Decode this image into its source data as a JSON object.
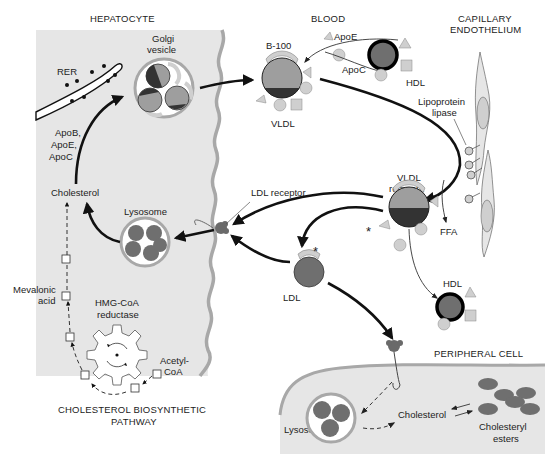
{
  "figure": {
    "colors": {
      "cell_fill": "#e6e6e6",
      "membrane": "#a8a8a8",
      "particle_core_light": "#9e9e9e",
      "particle_core_dark": "#3a3a3a",
      "ldl_core": "#6f6f6f",
      "apoprotein": "#cfcfcf",
      "hdl_ring": "#000000",
      "arrow": "#111111"
    }
  },
  "regions": {
    "hepatocyte": "HEPATOCYTE",
    "blood": "BLOOD",
    "capillary_endothelium_line1": "CAPILLARY",
    "capillary_endothelium_line2": "ENDOTHELIUM",
    "peripheral_cell": "PERIPHERAL CELL",
    "biosynthetic_pathway_line1": "CHOLESTEROL BIOSYNTHETIC",
    "biosynthetic_pathway_line2": "PATHWAY"
  },
  "labels": {
    "rer": "RER",
    "golgi_line1": "Golgi",
    "golgi_line2": "vesicle",
    "apob": "ApoB,",
    "apoe_list": "ApoE,",
    "apoc_list": "ApoC",
    "cholesterol_hepatocyte": "Cholesterol",
    "lysosome_hepatocyte": "Lysosome",
    "mevalonic_line1": "Mevalonic",
    "mevalonic_line2": "acid",
    "hmgcoa_line1": "HMG-CoA",
    "hmgcoa_line2": "reductase",
    "acetyl_line1": "Acetyl-",
    "acetyl_line2": "CoA",
    "b100": "B-100",
    "vldl": "VLDL",
    "apoe": "ApoE",
    "apoc": "ApoC",
    "hdl_top": "HDL",
    "lipoprotein_line1": "Lipoprotein",
    "lipoprotein_line2": "lipase",
    "ldl_receptor": "LDL receptor",
    "vldl_remnant_line1": "VLDL",
    "vldl_remnant_line2": "remnant",
    "ffa": "FFA",
    "ldl": "LDL",
    "hdl_bottom": "HDL",
    "asterisk": "*",
    "lysosome_peripheral": "Lysosome",
    "cholesterol_peripheral": "Cholesterol",
    "cholesteryl_line1": "Cholesteryl",
    "cholesteryl_line2": "esters"
  }
}
